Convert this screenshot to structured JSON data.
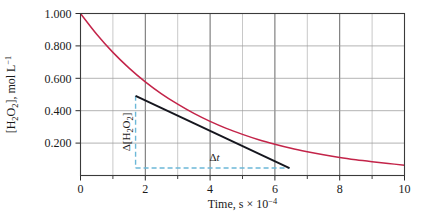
{
  "chart_data": {
    "type": "line",
    "title": "",
    "xlabel": "Time, s × 10⁻⁴",
    "ylabel": "[H₂O₂], mol L⁻¹",
    "xlim": [
      0,
      10
    ],
    "ylim": [
      0,
      1.0
    ],
    "grid": true,
    "legend": "none",
    "x_ticks_major": [
      "0",
      "2",
      "4",
      "6",
      "8",
      "10"
    ],
    "x_ticks_major_values": [
      0,
      2,
      4,
      6,
      8,
      10
    ],
    "x_ticks_minor_values": [
      1,
      3,
      5,
      7,
      9
    ],
    "y_ticks_major": [
      "0.200",
      "0.400",
      "0.600",
      "0.800",
      "1.000"
    ],
    "y_ticks_major_values": [
      0.2,
      0.4,
      0.6,
      0.8,
      1.0
    ],
    "series": [
      {
        "name": "[H2O2] decay curve",
        "kind": "exponential-decay",
        "color": "#c32449",
        "x": [
          0.0,
          0.5,
          1.0,
          1.5,
          2.0,
          2.5,
          3.0,
          3.5,
          4.0,
          4.5,
          5.0,
          5.5,
          6.0,
          6.5,
          7.0,
          7.5,
          8.0,
          8.5,
          9.0,
          9.5,
          10.0
        ],
        "y": [
          1.0,
          0.872,
          0.76,
          0.663,
          0.578,
          0.504,
          0.44,
          0.383,
          0.334,
          0.291,
          0.254,
          0.221,
          0.193,
          0.168,
          0.147,
          0.128,
          0.111,
          0.097,
          0.085,
          0.074,
          0.064
        ]
      },
      {
        "name": "tangent line at t = 3",
        "kind": "tangent",
        "color": "#15161e",
        "x": [
          1.7,
          6.45
        ],
        "y": [
          0.492,
          0.046
        ]
      }
    ],
    "annotations": [
      {
        "name": "delta-concentration",
        "label": "Δ[H₂O₂]",
        "orientation": "vertical",
        "color": "#6cb8d8",
        "x": 1.7,
        "y_from": 0.492,
        "y_to": 0.046
      },
      {
        "name": "delta-time",
        "label": "Δt",
        "orientation": "horizontal",
        "color": "#6cb8d8",
        "y": 0.046,
        "x_from": 1.7,
        "x_to": 6.45
      }
    ]
  }
}
